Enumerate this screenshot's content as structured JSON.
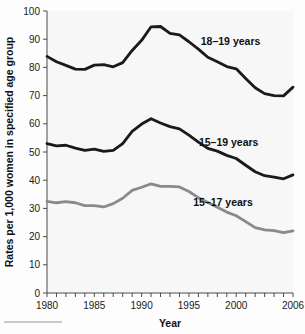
{
  "chart_data": {
    "type": "line",
    "title": "",
    "xlabel": "Year",
    "ylabel": "Rates per 1,000 women in specified age group",
    "xlim": [
      1980,
      2006
    ],
    "ylim": [
      0,
      100
    ],
    "ytick_step": 10,
    "xtick_step": 1,
    "grid": false,
    "legend_position": "inline-right",
    "x": [
      1980,
      1981,
      1982,
      1983,
      1984,
      1985,
      1986,
      1987,
      1988,
      1989,
      1990,
      1991,
      1992,
      1993,
      1994,
      1995,
      1996,
      1997,
      1998,
      1999,
      2000,
      2001,
      2002,
      2003,
      2004,
      2005,
      2006
    ],
    "ytick_labels": [
      "0",
      "10",
      "20",
      "30",
      "40",
      "50",
      "60",
      "70",
      "80",
      "90",
      "100"
    ],
    "xtick_labels": [
      "1980",
      "1985",
      "1990",
      "1995",
      "2000",
      "2006"
    ],
    "xtick_label_values": [
      1980,
      1985,
      1990,
      1995,
      2000,
      2006
    ],
    "series": [
      {
        "name": "18–19 years",
        "color": "#1a1a1a",
        "label_x": 1999.4,
        "label_y": 88.0,
        "values": [
          83.9,
          82.0,
          80.7,
          79.4,
          79.3,
          80.8,
          81.0,
          80.2,
          81.7,
          86.0,
          89.6,
          94.4,
          94.5,
          92.1,
          91.5,
          89.1,
          86.5,
          83.6,
          82.0,
          80.3,
          79.5,
          76.1,
          72.8,
          70.7,
          70.0,
          69.9,
          73.0
        ]
      },
      {
        "name": "15–19 years",
        "color": "#1a1a1a",
        "label_x": 1999.2,
        "label_y": 52.0,
        "values": [
          53.0,
          52.2,
          52.4,
          51.4,
          50.6,
          51.0,
          50.2,
          50.6,
          53.0,
          57.3,
          59.9,
          61.8,
          60.3,
          59.0,
          58.2,
          56.0,
          53.5,
          51.3,
          50.3,
          48.8,
          47.7,
          45.3,
          43.0,
          41.6,
          41.1,
          40.5,
          41.9
        ]
      },
      {
        "name": "15–17 years",
        "color": "#8a8a8a",
        "label_x": 1998.6,
        "label_y": 31.0,
        "values": [
          32.5,
          32.0,
          32.4,
          32.0,
          31.0,
          31.0,
          30.5,
          31.7,
          33.6,
          36.4,
          37.5,
          38.7,
          37.8,
          37.8,
          37.6,
          36.0,
          33.8,
          32.1,
          30.4,
          28.7,
          27.4,
          25.3,
          23.2,
          22.4,
          22.1,
          21.4,
          22.0
        ]
      }
    ]
  },
  "figure": {
    "footer_rule_visible": true
  }
}
